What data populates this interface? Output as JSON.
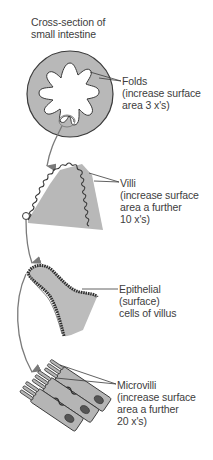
{
  "title": {
    "line1": "Cross-section of",
    "line2": "small intestine"
  },
  "labels": {
    "folds": {
      "line1": "Folds",
      "line2": "(increase surface",
      "line3": "area 3 x's)"
    },
    "villi": {
      "line1": "Villi",
      "line2": "(increase surface",
      "line3": "area a further",
      "line4": "10 x's)"
    },
    "epithelial": {
      "line1": "Epithelial",
      "line2": "(surface)",
      "line3": "cells of villus"
    },
    "microvilli": {
      "line1": "Microvilli",
      "line2": "(increase surface",
      "line3": "area a further",
      "line4": "20 x's)"
    }
  },
  "stages": [
    {
      "name": "Folds",
      "multiplier": "3 x's"
    },
    {
      "name": "Villi",
      "multiplier": "10 x's"
    },
    {
      "name": "Epithelial cells of villus",
      "multiplier": ""
    },
    {
      "name": "Microvilli",
      "multiplier": "20 x's"
    }
  ],
  "colors": {
    "tissue_fill": "#b8b8b8",
    "outline": "#3a3a3a",
    "arrow": "#7a7a7a",
    "text": "#3d3d3d",
    "background": "#ffffff"
  }
}
